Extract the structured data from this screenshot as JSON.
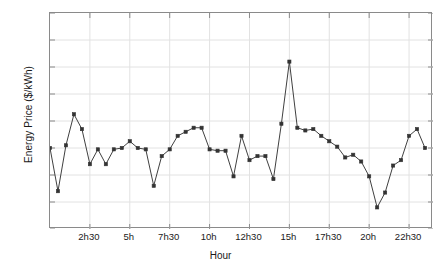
{
  "chart_data": {
    "type": "line",
    "title": "",
    "xlabel": "Hour",
    "ylabel": "Energy Price ($/kWh)",
    "ylim": [
      0.2,
      1.0
    ],
    "yticks": [
      0.2,
      0.3,
      0.4,
      0.5,
      0.6,
      0.7,
      0.8,
      0.9,
      1
    ],
    "ytick_labels": [
      "0.2",
      "0.3",
      "0.4",
      "0.5",
      "0.6",
      "0.7",
      "0.8",
      "0.9",
      "1"
    ],
    "xlim": [
      0,
      48
    ],
    "xticks": [
      5,
      10,
      15,
      20,
      25,
      30,
      35,
      40,
      45
    ],
    "xtick_labels": [
      "2h30",
      "5h",
      "7h30",
      "10h",
      "12h30",
      "15h",
      "17h30",
      "20h",
      "22h30"
    ],
    "grid": true,
    "legend": null,
    "marker": "square",
    "line_color": "#404040",
    "marker_color": "#333333",
    "grid_color": "#e2e2e2",
    "axis_color": "#8a8a8a",
    "series": [
      {
        "name": "Energy Price",
        "x": [
          0,
          1,
          2,
          3,
          4,
          5,
          6,
          7,
          8,
          9,
          10,
          11,
          12,
          13,
          14,
          15,
          16,
          17,
          18,
          19,
          20,
          21,
          22,
          23,
          24,
          25,
          26,
          27,
          28,
          29,
          30,
          31,
          32,
          33,
          34,
          35,
          36,
          37,
          38,
          39,
          40,
          41,
          42,
          43,
          44,
          45,
          46,
          47
        ],
        "values": [
          0.5,
          0.34,
          0.51,
          0.625,
          0.57,
          0.44,
          0.495,
          0.44,
          0.495,
          0.5,
          0.525,
          0.5,
          0.495,
          0.36,
          0.47,
          0.495,
          0.545,
          0.56,
          0.575,
          0.575,
          0.495,
          0.49,
          0.49,
          0.395,
          0.545,
          0.455,
          0.47,
          0.47,
          0.385,
          0.59,
          0.82,
          0.575,
          0.565,
          0.57,
          0.545,
          0.525,
          0.505,
          0.465,
          0.475,
          0.45,
          0.395,
          0.28,
          0.335,
          0.435,
          0.455,
          0.545,
          0.57,
          0.5
        ]
      }
    ]
  },
  "axes": {
    "x_title": "Hour",
    "y_title": "Energy Price ($/kWh)"
  }
}
